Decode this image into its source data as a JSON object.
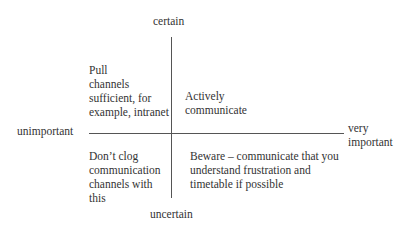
{
  "axes": {
    "top": "certain",
    "bottom": "uncertain",
    "left": "unimportant",
    "right": "very\nimportant"
  },
  "quadrants": {
    "top_left": "Pull\nchannels\nsufficient, for\nexample, intranet",
    "top_right": "Actively\ncommunicate",
    "bottom_left": "Don’t clog\ncommunication\nchannels with\nthis",
    "bottom_right": "Beware – communicate that you\nunderstand frustration and\ntimetable if possible"
  }
}
